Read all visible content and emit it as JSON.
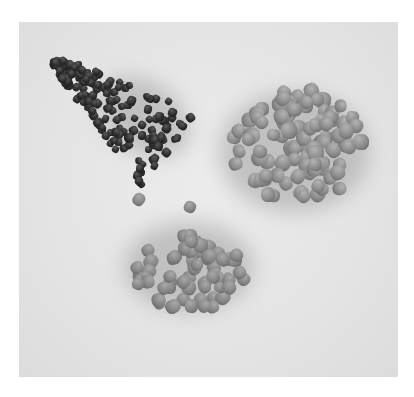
{
  "image": {
    "description": "Photograph of three piles of fish-feed pellets of different sizes and shades on a light gray surface",
    "background_color": "#e6e6e6",
    "border_color": "#ffffff",
    "piles": [
      {
        "name": "small-dark-pellets",
        "position": "top-left",
        "color": "#2c2c2c",
        "pellet_size": "small",
        "shape": "elongated triangular cluster"
      },
      {
        "name": "large-light-pellets",
        "position": "top-right",
        "color": "#8b8b8b",
        "pellet_size": "large",
        "shape": "round cluster"
      },
      {
        "name": "medium-pellets",
        "position": "bottom-center",
        "color": "#858585",
        "pellet_size": "medium",
        "shape": "round cluster"
      }
    ]
  }
}
